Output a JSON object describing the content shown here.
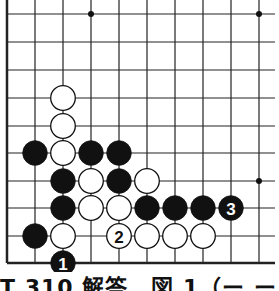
{
  "diagram": {
    "type": "go-board-fragment",
    "grid": {
      "x_lines": [
        7,
        35,
        63,
        91,
        119,
        147,
        175,
        203,
        231,
        259
      ],
      "y_lines": [
        14,
        42,
        70,
        98,
        126,
        153,
        181,
        208,
        236,
        263
      ],
      "left_edge": true,
      "bottom_edge": true,
      "line_color": "#222222"
    },
    "hoshi": [
      [
        3,
        0
      ],
      [
        9,
        0
      ],
      [
        9,
        6
      ]
    ],
    "stones": [
      {
        "color": "white",
        "col": 2,
        "row": 3,
        "label": ""
      },
      {
        "color": "white",
        "col": 2,
        "row": 4,
        "label": ""
      },
      {
        "color": "black",
        "col": 1,
        "row": 5,
        "label": ""
      },
      {
        "color": "white",
        "col": 2,
        "row": 5,
        "label": ""
      },
      {
        "color": "black",
        "col": 3,
        "row": 5,
        "label": ""
      },
      {
        "color": "black",
        "col": 4,
        "row": 5,
        "label": ""
      },
      {
        "color": "black",
        "col": 2,
        "row": 6,
        "label": ""
      },
      {
        "color": "white",
        "col": 3,
        "row": 6,
        "label": ""
      },
      {
        "color": "black",
        "col": 4,
        "row": 6,
        "label": ""
      },
      {
        "color": "white",
        "col": 5,
        "row": 6,
        "label": ""
      },
      {
        "color": "black",
        "col": 2,
        "row": 7,
        "label": ""
      },
      {
        "color": "white",
        "col": 3,
        "row": 7,
        "label": ""
      },
      {
        "color": "white",
        "col": 4,
        "row": 7,
        "label": ""
      },
      {
        "color": "black",
        "col": 5,
        "row": 7,
        "label": ""
      },
      {
        "color": "black",
        "col": 6,
        "row": 7,
        "label": ""
      },
      {
        "color": "black",
        "col": 7,
        "row": 7,
        "label": ""
      },
      {
        "color": "black",
        "col": 8,
        "row": 7,
        "label": "3"
      },
      {
        "color": "black",
        "col": 1,
        "row": 8,
        "label": ""
      },
      {
        "color": "white",
        "col": 2,
        "row": 8,
        "label": ""
      },
      {
        "color": "white",
        "col": 4,
        "row": 8,
        "label": "2"
      },
      {
        "color": "white",
        "col": 5,
        "row": 8,
        "label": ""
      },
      {
        "color": "white",
        "col": 6,
        "row": 8,
        "label": ""
      },
      {
        "color": "white",
        "col": 7,
        "row": 8,
        "label": ""
      },
      {
        "color": "black",
        "col": 2,
        "row": 9,
        "label": "1"
      }
    ]
  },
  "caption": {
    "text": "T 310 解答　図 1（ー ー"
  }
}
